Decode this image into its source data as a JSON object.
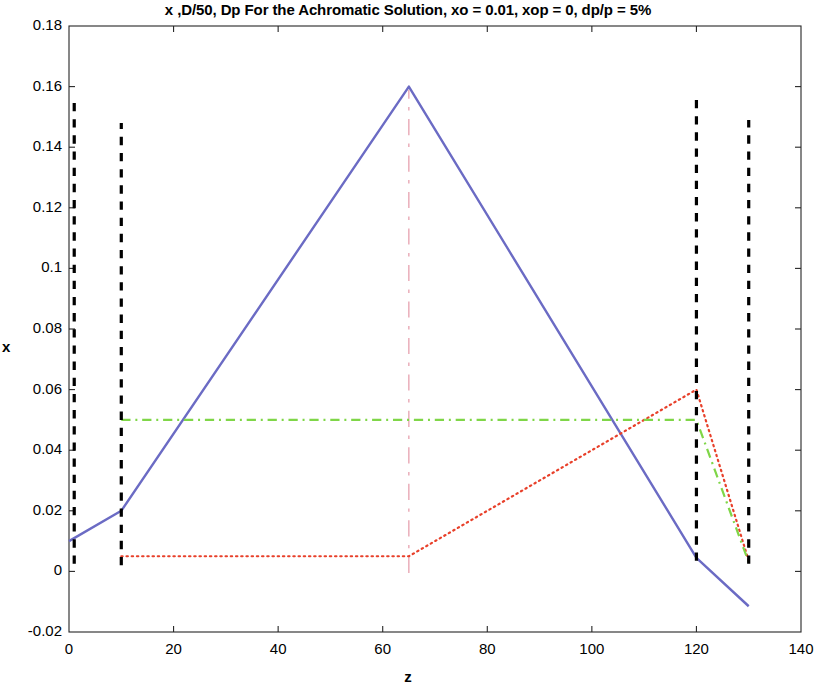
{
  "chart_data": {
    "type": "line",
    "title": "x ,D/50, Dp For the Achromatic Solution, xo = 0.01, xop = 0, dp/p = 5%",
    "xlabel": "z",
    "ylabel": "x",
    "xlim": [
      0,
      140
    ],
    "ylim": [
      -0.02,
      0.18
    ],
    "xticks": [
      0,
      20,
      40,
      60,
      80,
      100,
      120,
      140
    ],
    "xtick_labels": [
      "0",
      "20",
      "40",
      "60",
      "80",
      "100",
      "120",
      "140"
    ],
    "yticks": [
      -0.02,
      0,
      0.02,
      0.04,
      0.06,
      0.08,
      0.1,
      0.12,
      0.14,
      0.16,
      0.18
    ],
    "ytick_labels": [
      "-0.02",
      "0",
      "0.02",
      "0.04",
      "0.06",
      "0.08",
      "0.1",
      "0.12",
      "0.14",
      "0.16",
      "0.18"
    ],
    "grid": false,
    "legend": "none",
    "box": true,
    "series": [
      {
        "name": "x",
        "color": "#6B6BC4",
        "style": "solid",
        "width": 2.4,
        "points": [
          [
            0,
            0.01
          ],
          [
            10,
            0.02
          ],
          [
            65,
            0.16
          ],
          [
            120,
            0.0045
          ],
          [
            130,
            -0.0115
          ]
        ]
      },
      {
        "name": "Dp",
        "color": "#E8402A",
        "style": "dotted",
        "width": 2.2,
        "points": [
          [
            10,
            0.005
          ],
          [
            65,
            0.005
          ],
          [
            120,
            0.06
          ],
          [
            130,
            0.0035
          ]
        ]
      },
      {
        "name": "D/50",
        "color": "#7FD648",
        "style": "dashdot",
        "width": 2.2,
        "points": [
          [
            10,
            0.05
          ],
          [
            120,
            0.05
          ],
          [
            130,
            0.003
          ]
        ]
      }
    ],
    "vertical_markers": [
      {
        "name": "element-boundary-1",
        "z": 1,
        "color": "#000000",
        "style": "dashed",
        "y_from": 0.0025,
        "y_to": 0.1555,
        "width": 3.2
      },
      {
        "name": "element-boundary-2",
        "z": 10,
        "color": "#000000",
        "style": "dashed",
        "y_from": 0.002,
        "y_to": 0.148,
        "width": 3.2
      },
      {
        "name": "element-boundary-3",
        "z": 120,
        "color": "#000000",
        "style": "dashed",
        "y_from": 0.0035,
        "y_to": 0.156,
        "width": 3.2
      },
      {
        "name": "element-boundary-4",
        "z": 130,
        "color": "#000000",
        "style": "dashed",
        "y_from": 0.0025,
        "y_to": 0.149,
        "width": 3.2
      }
    ],
    "center-marker": {
      "name": "symmetry-axis",
      "z": 65,
      "color": "#E59AA8",
      "style": "dashdot",
      "y_from": -0.0005,
      "y_to": 0.159,
      "width": 1.2
    },
    "annotations": []
  }
}
